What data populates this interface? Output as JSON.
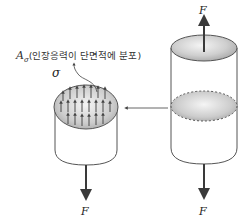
{
  "diagram": {
    "type": "stress-distribution-free-body",
    "labels": {
      "force_top_right": "F",
      "force_bottom_right": "F",
      "force_bottom_left": "F",
      "sigma": "σ",
      "area_symbol": "A",
      "area_subscript": "σ",
      "area_caption": "(인장응력이 단면적에 분포)"
    },
    "colors": {
      "outline": "#555555",
      "arrow": "#3a3a3a",
      "section_fill_light": "#f2f2f2",
      "section_fill_dark": "#a8a8a8"
    },
    "left_body": {
      "description": "cut bar with tensile stress arrows on cross-section",
      "stress_arrow_rows": 3
    },
    "right_body": {
      "description": "whole bar with dashed internal cross-section"
    },
    "connector": {
      "direction": "right-to-left",
      "description": "arrow from internal section to free body"
    }
  }
}
